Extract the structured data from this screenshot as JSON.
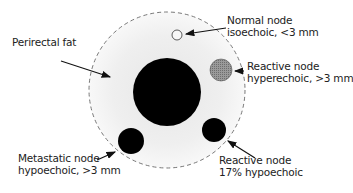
{
  "diagram": {
    "type": "anatomical-schematic",
    "colors": {
      "fat_region": "#ececec",
      "rectum": "#000000",
      "normal_node_fill": "#f5f5f5",
      "hyperechoic_node_fill": "#8c8c8c",
      "hypoechoic_node_fill": "#000000",
      "boundary_dash": "#777777"
    },
    "labels": {
      "perirectal_fat": [
        "Perirectal fat"
      ],
      "normal_node": [
        "Normal node",
        "isoechoic, <3 mm"
      ],
      "reactive_hyperechoic": [
        "Reactive node",
        "hyperechoic, >3 mm"
      ],
      "metastatic_node": [
        "Metastatic node",
        "hypoechoic, >3 mm"
      ],
      "reactive_hypoechoic": [
        "Reactive node",
        "17% hypoechoic"
      ]
    }
  }
}
